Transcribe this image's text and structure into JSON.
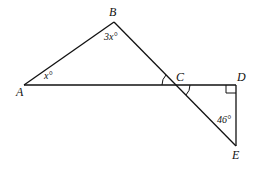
{
  "diagram": {
    "points": {
      "A": {
        "label": "A",
        "x": 24,
        "y": 85
      },
      "B": {
        "label": "B",
        "x": 114,
        "y": 22
      },
      "C": {
        "label": "C",
        "x": 176,
        "y": 85
      },
      "D": {
        "label": "D",
        "x": 236,
        "y": 85
      },
      "E": {
        "label": "E",
        "x": 236,
        "y": 146
      }
    },
    "angles": {
      "A": "x°",
      "B": "3x°",
      "E": "46°"
    },
    "right_angle_at": "D",
    "vertical_angle_arcs_at": "C",
    "segments": [
      "AB",
      "BE",
      "AD",
      "DE"
    ],
    "stroke_color": "#111111"
  }
}
